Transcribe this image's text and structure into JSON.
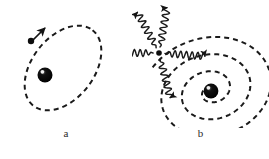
{
  "figure": {
    "background_color": "#ffffff",
    "ink_color": "#1a1a1a",
    "width": 269,
    "height": 159
  },
  "panels": [
    {
      "id": "a",
      "caption": "a",
      "description": "stable circular-elliptical electron orbit around nucleus",
      "nucleus": {
        "label": "nucleus",
        "cx": 45,
        "cy": 75,
        "r": 7.5,
        "color": "#111111",
        "highlight_color": "#ffffff"
      },
      "electron": {
        "label": "electron",
        "cx": 31,
        "cy": 41,
        "r": 3.2,
        "color": "#111111"
      },
      "orbit": {
        "label": "orbit-path",
        "style": "dashed",
        "cx": 63,
        "cy": 68,
        "rx": 48,
        "ry": 31,
        "rotation_deg": -52,
        "dash": "5 4",
        "stroke_width": 2.0
      },
      "velocity_arrow": {
        "label": "velocity-arrow",
        "x1": 32,
        "y1": 41,
        "x2": 45,
        "y2": 28
      }
    },
    {
      "id": "b",
      "caption": "b",
      "description": "electron spirals into nucleus while radiating photons",
      "nucleus": {
        "label": "nucleus",
        "cx": 79,
        "cy": 91,
        "r": 7.5,
        "color": "#111111",
        "highlight_color": "#ffffff"
      },
      "electron": {
        "label": "electron",
        "cx": 27,
        "cy": 53,
        "r": 2.8,
        "color": "#111111"
      },
      "spiral": {
        "label": "decaying-spiral-path",
        "style": "dashed",
        "dash": "5 4",
        "stroke_width": 2.0,
        "turns": 3,
        "center_x": 79,
        "center_y": 91,
        "r_start": 62,
        "r_end": 6
      },
      "photons": [
        {
          "label": "photon-up-left",
          "angle_deg": -118,
          "length": 46,
          "amplitude": 3.4,
          "waves": 6
        },
        {
          "label": "photon-up-right",
          "angle_deg": -80,
          "length": 46,
          "amplitude": 3.4,
          "waves": 6
        },
        {
          "label": "photon-left",
          "angle_deg": 180,
          "length": 46,
          "amplitude": 3.4,
          "waves": 7
        },
        {
          "label": "photon-right",
          "angle_deg": 4,
          "length": 46,
          "amplitude": 3.4,
          "waves": 7
        },
        {
          "label": "photon-down",
          "angle_deg": 76,
          "length": 46,
          "amplitude": 3.4,
          "waves": 6
        }
      ]
    }
  ]
}
